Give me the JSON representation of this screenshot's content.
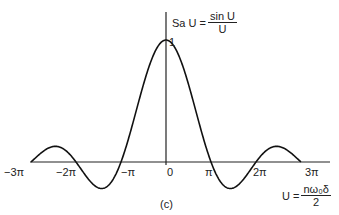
{
  "chart_data": {
    "type": "line",
    "xlabel": "U = nω0δ / 2",
    "ylabel": "",
    "caption": "(c)",
    "x_ticks": [
      "-3π",
      "-2π",
      "-π",
      "0",
      "π",
      "2π",
      "3π"
    ],
    "y_ticks": [
      "1"
    ],
    "xlim": [
      -9.42,
      9.42
    ],
    "ylim": [
      -0.25,
      1.05
    ],
    "grid": false,
    "series": [
      {
        "name": "Sa U",
        "x": [
          -9.42,
          -7.73,
          -6.28,
          -4.49,
          -3.14,
          -1.57,
          0,
          1.57,
          3.14,
          4.49,
          6.28,
          7.73,
          9.42
        ],
        "values": [
          0,
          0.128,
          0,
          -0.217,
          0,
          0.637,
          1,
          0.637,
          0,
          -0.217,
          0,
          0.128,
          0
        ]
      }
    ]
  },
  "labels": {
    "func_prefix": "Sa U =",
    "func_num": "sin U",
    "func_den": "U",
    "y_one": "1",
    "x_prefix": "U =",
    "x_num": "nω₀δ",
    "x_den": "2",
    "caption": "(c)",
    "ticks": {
      "m3pi": "−3π",
      "m2pi": "−2π",
      "mpi": "−π",
      "zero": "0",
      "pi": "π",
      "p2pi": "2π",
      "p3pi": "3π"
    }
  }
}
